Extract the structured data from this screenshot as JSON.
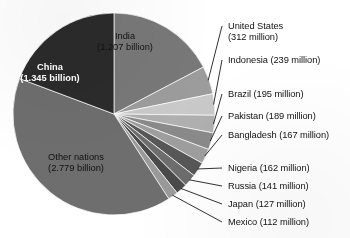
{
  "chart_data": {
    "type": "pie",
    "title": "",
    "unit": "millions of people",
    "total": 6975,
    "center": {
      "x": 114,
      "y": 114,
      "r": 101
    },
    "start_angle_deg": -90,
    "direction": "clockwise",
    "legend": "inline-labels-with-leader-lines",
    "categories": [
      "India",
      "United States",
      "Indonesia",
      "Brazil",
      "Pakistan",
      "Bangladesh",
      "Nigeria",
      "Russia",
      "Japan",
      "Mexico",
      "Other nations",
      "China"
    ],
    "values": [
      1207,
      312,
      239,
      195,
      189,
      167,
      162,
      141,
      127,
      112,
      2779,
      1345
    ],
    "slices": [
      {
        "name": "India",
        "label": "India",
        "value_text": "(1.207 billion)",
        "value": 1207,
        "color": "#787878",
        "placement": "inside",
        "text_color": "dark",
        "x": 125,
        "y": 31,
        "align": "center"
      },
      {
        "name": "United States",
        "label": "United States",
        "value_text": "(312 million)",
        "value": 312,
        "color": "#9c9c9c",
        "placement": "outside",
        "text_color": "dark",
        "x": 228,
        "y": 21,
        "align": "left"
      },
      {
        "name": "Indonesia",
        "label": "Indonesia",
        "value_text": "(239 million)",
        "value": 239,
        "color": "#c9c9c9",
        "placement": "outside",
        "text_color": "dark",
        "x": 228,
        "y": 55,
        "align": "left"
      },
      {
        "name": "Brazil",
        "label": "Brazil",
        "value_text": "(195 million)",
        "value": 195,
        "color": "#b0b0b0",
        "placement": "outside",
        "text_color": "dark",
        "x": 228,
        "y": 89,
        "align": "left"
      },
      {
        "name": "Pakistan",
        "label": "Pakistan",
        "value_text": "(189 million)",
        "value": 189,
        "color": "#8a8a8a",
        "placement": "outside",
        "text_color": "dark",
        "x": 228,
        "y": 111,
        "align": "left"
      },
      {
        "name": "Bangladesh",
        "label": "Bangladesh",
        "value_text": "(167 million)",
        "value": 167,
        "color": "#9e9e9e",
        "placement": "outside",
        "text_color": "dark",
        "x": 228,
        "y": 130,
        "align": "left"
      },
      {
        "name": "Nigeria",
        "label": "Nigeria",
        "value_text": "(162 million)",
        "value": 162,
        "color": "#575757",
        "placement": "outside",
        "text_color": "dark",
        "x": 228,
        "y": 163,
        "align": "left"
      },
      {
        "name": "Russia",
        "label": "Russia",
        "value_text": "(141 million)",
        "value": 141,
        "color": "#6d6d6d",
        "placement": "outside",
        "text_color": "dark",
        "x": 228,
        "y": 181,
        "align": "left"
      },
      {
        "name": "Japan",
        "label": "Japan",
        "value_text": "(127 million)",
        "value": 127,
        "color": "#4a4a4a",
        "placement": "outside",
        "text_color": "dark",
        "x": 228,
        "y": 199,
        "align": "left"
      },
      {
        "name": "Mexico",
        "label": "Mexico",
        "value_text": "(112 million)",
        "value": 112,
        "color": "#9a9a9a",
        "placement": "outside",
        "text_color": "dark",
        "x": 228,
        "y": 217,
        "align": "left"
      },
      {
        "name": "Other nations",
        "label": "Other nations",
        "value_text": "(2.779 billion)",
        "value": 2779,
        "color": "#6e6e6e",
        "placement": "inside",
        "text_color": "dark",
        "x": 76,
        "y": 152,
        "align": "center"
      },
      {
        "name": "China",
        "label": "China",
        "value_text": "(1.345 billion)",
        "value": 1345,
        "color": "#2b2b2b",
        "placement": "inside",
        "text_color": "light",
        "x": 50,
        "y": 62,
        "align": "center"
      }
    ]
  }
}
